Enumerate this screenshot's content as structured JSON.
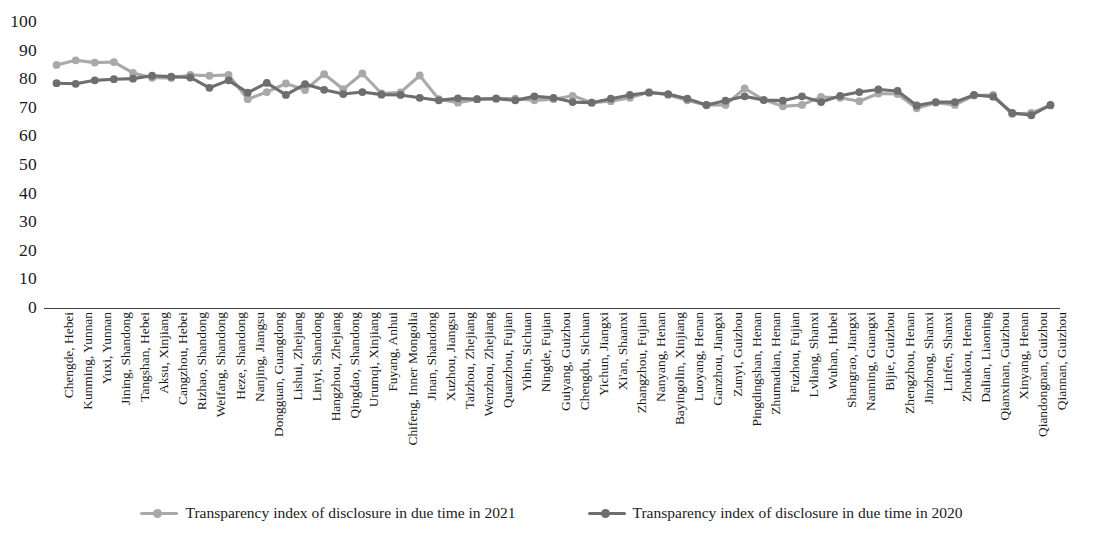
{
  "chart_data": {
    "type": "line",
    "title": "",
    "subtitle": "",
    "xlabel": "",
    "ylabel": "",
    "ylim": [
      0,
      100
    ],
    "ytick_step": 10,
    "yticks": [
      100,
      90,
      80,
      70,
      60,
      50,
      40,
      30,
      20,
      10,
      0
    ],
    "grid": false,
    "legend_position": "bottom-center",
    "categories": [
      "Chengde, Hebei",
      "Kunming, Yunnan",
      "Yuxi, Yunnan",
      "Jining, Shandong",
      "Tangshan, Hebei",
      "Aksu, Xinjiang",
      "Cangzhou, Hebei",
      "Rizhao, Shandong",
      "Weifang, Shandong",
      "Heze, Shandong",
      "Nanjing, Jiangsu",
      "Dongguan, Guangdong",
      "Lishui, Zhejiang",
      "Linyi, Shandong",
      "Hangzhou, Zhejiang",
      "Qingdao, Shandong",
      "Urumqi, Xinjiang",
      "Fuyang, Anhui",
      "Chifeng, Inner Mongolia",
      "Jinan, Shandong",
      "Xuzhou, Jiangsu",
      "Taizhou, Zhejiang",
      "Wenzhou, Zhejiang",
      "Quanzhou, Fujian",
      "Yibin, Sichuan",
      "Ningde, Fujian",
      "Guiyang, Guizhou",
      "Chengdu, Sichuan",
      "Yichun, Jiangxi",
      "Xi'an, Shaanxi",
      "Zhangzhou, Fujian",
      "Nanyang, Henan",
      "Bayingolin, Xinjiang",
      "Luoyang, Henan",
      "Ganzhou, Jiangxi",
      "Zunyi, Guizhou",
      "Pingdingshan, Henan",
      "Zhumadian, Henan",
      "Fuzhou, Fujian",
      "Lvliang, Shanxi",
      "Wuhan, Hubei",
      "Shangrao, Jiangxi",
      "Nanning, Guangxi",
      "Bijie, Guizhou",
      "Zhengzhou, Henan",
      "Jinzhong, Shanxi",
      "Linfen, Shanxi",
      "Zhoukou, Henan",
      "Dalian, Liaoning",
      "Qianxinan, Guizhou",
      "Xinyang, Henan",
      "Qiandongnan, Guizhou",
      "Qiannan, Guizhou"
    ],
    "series": [
      {
        "name": "Transparency index of disclosure in due time in 2021",
        "color": "#a9a9a9",
        "values": [
          85.0,
          86.6,
          85.8,
          86.0,
          82.2,
          80.5,
          80.4,
          81.5,
          81.2,
          81.5,
          73.0,
          75.5,
          78.5,
          76.2,
          81.8,
          76.5,
          82.0,
          75.0,
          75.4,
          81.3,
          73.0,
          71.8,
          73.0,
          73.3,
          73.2,
          72.6,
          73.0,
          74.2,
          71.8,
          72.3,
          73.5,
          75.5,
          74.5,
          72.6,
          70.9,
          71.0,
          76.8,
          72.8,
          70.5,
          71.0,
          73.8,
          73.5,
          72.3,
          75.0,
          74.8,
          69.8,
          71.8,
          71.0,
          74.3,
          74.5,
          67.8,
          68.2,
          70.8
        ]
      },
      {
        "name": "Transparency index of disclosure in due time in 2020",
        "color": "#6e6e6e",
        "values": [
          78.6,
          78.4,
          79.6,
          80.0,
          80.2,
          81.2,
          80.9,
          80.6,
          77.0,
          79.6,
          75.3,
          78.7,
          74.5,
          78.3,
          76.3,
          74.8,
          75.5,
          74.6,
          74.5,
          73.5,
          72.6,
          73.3,
          73.0,
          73.2,
          72.6,
          74.0,
          73.5,
          72.0,
          71.8,
          73.2,
          74.5,
          75.3,
          74.8,
          73.2,
          71.0,
          72.5,
          74.0,
          72.7,
          72.5,
          74.0,
          72.0,
          74.2,
          75.5,
          76.4,
          75.9,
          70.8,
          72.0,
          72.0,
          74.5,
          73.9,
          68.2,
          67.4,
          71.0
        ]
      }
    ]
  },
  "legend": {
    "entries": [
      {
        "label": "Transparency index of disclosure in due time in 2021"
      },
      {
        "label": "Transparency index of disclosure in due time in 2020"
      }
    ]
  },
  "caption": {
    "text": ""
  }
}
